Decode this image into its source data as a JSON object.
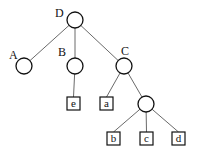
{
  "diagram": {
    "type": "tree",
    "nodes": [
      {
        "id": "D",
        "label": "D",
        "shape": "circle",
        "cx": 75,
        "cy": 20,
        "r": 8,
        "lx": 55,
        "ly": 17
      },
      {
        "id": "A",
        "label": "A",
        "shape": "circle",
        "cx": 24,
        "cy": 66,
        "r": 8,
        "lx": 9,
        "ly": 59
      },
      {
        "id": "B",
        "label": "B",
        "shape": "circle",
        "cx": 75,
        "cy": 66,
        "r": 8,
        "lx": 58,
        "ly": 56
      },
      {
        "id": "C",
        "label": "C",
        "shape": "circle",
        "cx": 124,
        "cy": 66,
        "r": 8,
        "lx": 121,
        "ly": 55
      },
      {
        "id": "n1",
        "label": "",
        "shape": "circle",
        "cx": 146,
        "cy": 104,
        "r": 8,
        "lx": 0,
        "ly": 0
      },
      {
        "id": "e",
        "label": "e",
        "shape": "box",
        "x": 67,
        "y": 97,
        "w": 13,
        "h": 13
      },
      {
        "id": "a",
        "label": "a",
        "shape": "box",
        "x": 100,
        "y": 97,
        "w": 13,
        "h": 13
      },
      {
        "id": "b",
        "label": "b",
        "shape": "box",
        "x": 107,
        "y": 132,
        "w": 13,
        "h": 13
      },
      {
        "id": "c",
        "label": "c",
        "shape": "box",
        "x": 140,
        "y": 132,
        "w": 13,
        "h": 13
      },
      {
        "id": "d",
        "label": "d",
        "shape": "box",
        "x": 172,
        "y": 132,
        "w": 13,
        "h": 13
      }
    ],
    "edges": [
      {
        "from": "D",
        "to": "A"
      },
      {
        "from": "D",
        "to": "B"
      },
      {
        "from": "D",
        "to": "C"
      },
      {
        "from": "B",
        "to": "e"
      },
      {
        "from": "C",
        "to": "a"
      },
      {
        "from": "C",
        "to": "n1"
      },
      {
        "from": "n1",
        "to": "b"
      },
      {
        "from": "n1",
        "to": "c"
      },
      {
        "from": "n1",
        "to": "d"
      }
    ]
  }
}
